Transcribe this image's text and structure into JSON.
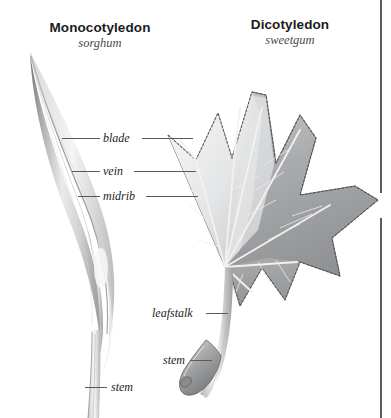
{
  "figure": {
    "background_color": "#ffffff",
    "style": "grayscale botanical illustration",
    "rule_color": "#5c5c5c"
  },
  "specimens": [
    {
      "common_name": "Monocotyledon",
      "scientific_name": "sorghum",
      "leaf_type": "long narrow grass blade with parallel veins"
    },
    {
      "common_name": "Dicotyledon",
      "scientific_name": "sweetgum",
      "leaf_type": "five-lobed star shaped leaf with palmate netted veins"
    }
  ],
  "labels": {
    "blade": "blade",
    "vein": "vein",
    "midrib": "midrib",
    "leafstalk": "leafstalk",
    "stem_dicot": "stem",
    "stem_monocot": "stem"
  }
}
